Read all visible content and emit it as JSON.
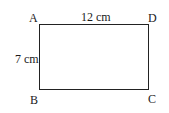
{
  "diagram": {
    "shape": "rectangle",
    "vertices": {
      "top_left": "A",
      "top_right": "D",
      "bottom_left": "B",
      "bottom_right": "C"
    },
    "labels": {
      "top_side": "12 cm",
      "left_side": "7 cm"
    },
    "colors": {
      "stroke": "#222222",
      "text": "#1a1a1a",
      "background": "#ffffff"
    }
  }
}
